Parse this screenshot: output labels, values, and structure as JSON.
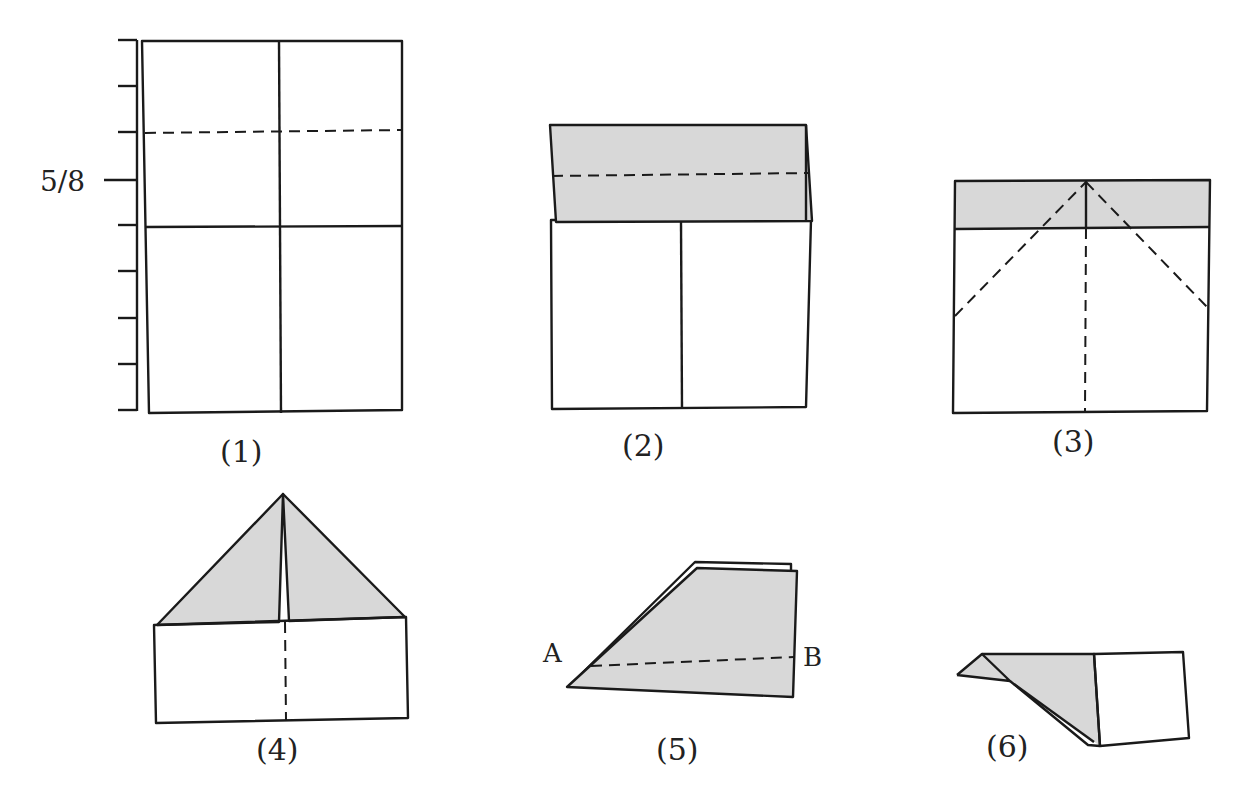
{
  "figure": {
    "shade_color": "#d8d8d8",
    "line_color": "#1a1a1a",
    "ruler": {
      "tick_count": 9,
      "label": "5/8"
    },
    "steps": [
      {
        "number": 1,
        "label": "(1)",
        "description": "Rectangle with center crease; dashed fold line; ruler at left with 5/8 mark"
      },
      {
        "number": 2,
        "label": "(2)",
        "description": "Top folded down (shaded), dashed fold line"
      },
      {
        "number": 3,
        "label": "(3)",
        "description": "Shaded top strip, two diagonal dashed fold lines from top center"
      },
      {
        "number": 4,
        "label": "(4)",
        "description": "Corners folded to center forming shaded triangle, dashed center line"
      },
      {
        "number": 5,
        "label": "(5)",
        "description": "Folded in half, dashed line from A to B",
        "points": [
          "A",
          "B"
        ]
      },
      {
        "number": 6,
        "label": "(6)",
        "description": "Wing folded down, finished airplane"
      }
    ]
  }
}
